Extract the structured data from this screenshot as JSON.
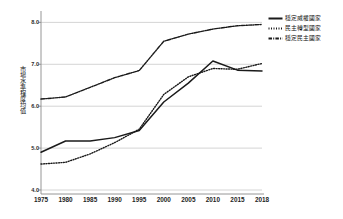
{
  "chart_data": {
    "type": "line",
    "title": "",
    "subtitle": "",
    "xlabel": "",
    "ylabel": "市場水準程度均值",
    "x": [
      1975,
      1980,
      1985,
      1990,
      1995,
      2000,
      2005,
      2010,
      2015,
      2018
    ],
    "xtick_labels": [
      "1975",
      "1980",
      "1985",
      "1990",
      "1995",
      "2000",
      "2005",
      "2010",
      "2015",
      "2018"
    ],
    "ytick_labels": [
      "8.0",
      "7.0",
      "6.0",
      "5.0",
      "4.0"
    ],
    "ytick_values": [
      8.0,
      7.0,
      6.0,
      5.0,
      4.0
    ],
    "ylim": [
      4.0,
      8.2
    ],
    "xlim": [
      1975,
      2018
    ],
    "grid": "horizontal",
    "legend_position": "right",
    "series": [
      {
        "name": "穩定威權國家",
        "style": "solid",
        "color": "#1a1a1a",
        "values": [
          4.9,
          5.17,
          5.17,
          5.25,
          5.42,
          6.1,
          6.55,
          7.08,
          6.86,
          6.84
        ]
      },
      {
        "name": "民主轉型國家",
        "style": "dotted",
        "color": "#1a1a1a",
        "values": [
          4.62,
          4.66,
          4.86,
          5.13,
          5.45,
          6.28,
          6.7,
          6.9,
          6.88,
          7.02
        ]
      },
      {
        "name": "穩定民主國家",
        "style": "dash-dot",
        "color": "#1a1a1a",
        "values": [
          6.17,
          6.22,
          6.45,
          6.68,
          6.85,
          7.55,
          7.72,
          7.84,
          7.92,
          7.95
        ]
      }
    ]
  },
  "legend": {
    "items": [
      {
        "label": "穩定威權國家",
        "style": "solid"
      },
      {
        "label": "民主轉型國家",
        "style": "dotted"
      },
      {
        "label": "穩定民主國家",
        "style": "dash-dot"
      }
    ]
  },
  "colors": {
    "line": "#1a1a1a",
    "grid": "#c9c9c9",
    "axis": "#8a8a8a",
    "background": "#ffffff"
  }
}
